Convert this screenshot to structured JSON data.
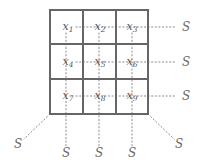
{
  "figure": {
    "grid": {
      "stroke_color": "#666666",
      "cells": [
        {
          "id": "cell-x1",
          "var": "x",
          "sub": "1",
          "cx": 68,
          "cy": 27
        },
        {
          "id": "cell-x2",
          "var": "x",
          "sub": "2",
          "cx": 100,
          "cy": 27
        },
        {
          "id": "cell-x3",
          "var": "x",
          "sub": "3",
          "cx": 132,
          "cy": 27
        },
        {
          "id": "cell-x4",
          "var": "x",
          "sub": "4",
          "cx": 68,
          "cy": 62
        },
        {
          "id": "cell-x5",
          "var": "x",
          "sub": "5",
          "cx": 100,
          "cy": 62
        },
        {
          "id": "cell-x6",
          "var": "x",
          "sub": "6",
          "cx": 132,
          "cy": 62
        },
        {
          "id": "cell-x7",
          "var": "x",
          "sub": "7",
          "cx": 68,
          "cy": 96
        },
        {
          "id": "cell-x8",
          "var": "x",
          "sub": "8",
          "cx": 100,
          "cy": 96
        },
        {
          "id": "cell-x9",
          "var": "x",
          "sub": "9",
          "cx": 132,
          "cy": 96
        }
      ]
    },
    "s_labels": [
      {
        "id": "s-right-row1",
        "text": "S",
        "cx": 186,
        "cy": 27
      },
      {
        "id": "s-right-row2",
        "text": "S",
        "cx": 186,
        "cy": 62
      },
      {
        "id": "s-right-row3",
        "text": "S",
        "cx": 186,
        "cy": 96
      },
      {
        "id": "s-bottom-left-diagonal",
        "text": "S",
        "cx": 18,
        "cy": 144
      },
      {
        "id": "s-bottom-col1",
        "text": "S",
        "cx": 66,
        "cy": 153
      },
      {
        "id": "s-bottom-col2",
        "text": "S",
        "cx": 99,
        "cy": 153
      },
      {
        "id": "s-bottom-col3",
        "text": "S",
        "cx": 132,
        "cy": 153
      },
      {
        "id": "s-bottom-right-diagonal",
        "text": "S",
        "cx": 179,
        "cy": 144
      }
    ],
    "dotted_color": "#8a8a8a"
  }
}
